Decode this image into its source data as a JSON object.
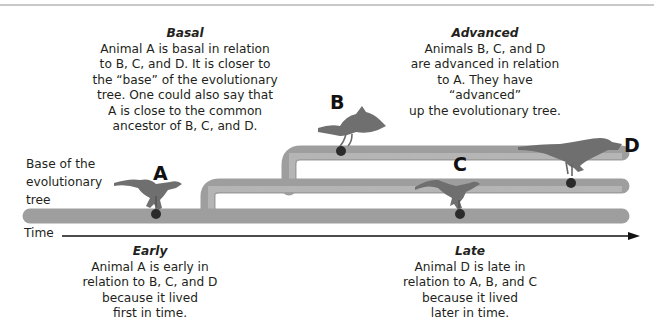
{
  "diagram": {
    "labels": {
      "base": "Base of the evolutionary tree",
      "base_lines": [
        "Base of the",
        "evolutionary",
        "tree"
      ],
      "time": "Time"
    },
    "animals": [
      {
        "id": "A",
        "label": "A",
        "branch": "trunk",
        "order_in_time": 1
      },
      {
        "id": "B",
        "label": "B",
        "branch": "upper",
        "order_in_time": 2
      },
      {
        "id": "C",
        "label": "C",
        "branch": "trunk",
        "order_in_time": 3
      },
      {
        "id": "D",
        "label": "D",
        "branch": "middle",
        "order_in_time": 4
      }
    ],
    "colors": {
      "branch": "#b3b3b3",
      "branch_edge": "#9a9a9a",
      "node": "#2b2b2b",
      "animal": "#6f6f6f",
      "text": "#231f20"
    }
  },
  "annotations": {
    "basal": {
      "heading": "Basal",
      "lines": [
        "Animal A is basal in relation",
        "to B, C, and D. It is closer to",
        "the “base” of the evolutionary",
        "tree. One could also say that",
        "A is close to the common",
        "ancestor of B, C, and D."
      ]
    },
    "advanced": {
      "heading": "Advanced",
      "lines": [
        "Animals B, C, and D",
        "are advanced in relation",
        "to A. They have “advanced”",
        "up the evolutionary tree."
      ]
    },
    "early": {
      "heading": "Early",
      "lines": [
        "Animal A is early in",
        "relation to B, C, and D",
        "because it lived",
        "first in time."
      ]
    },
    "late": {
      "heading": "Late",
      "lines": [
        "Animal D is late in",
        "relation to A, B, and C",
        "because it lived",
        "later in time."
      ]
    }
  }
}
